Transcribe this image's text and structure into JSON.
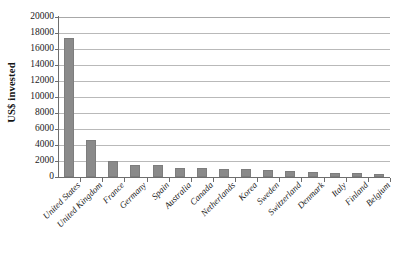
{
  "chart_data": {
    "type": "bar",
    "title": "",
    "xlabel": "",
    "ylabel": "US$ invested",
    "ylim": [
      0,
      20000
    ],
    "ytick_step": 2000,
    "grid": true,
    "legend": "none",
    "bar_color": "#8a8a8a",
    "gridline_color": "#b9b9b9",
    "axis_color": "#6e6e6e",
    "yticks": [
      "20000",
      "18000",
      "16000",
      "14000",
      "12000",
      "10000",
      "8000",
      "6000",
      "4000",
      "2000",
      "0"
    ],
    "ytick_values": [
      20000,
      18000,
      16000,
      14000,
      12000,
      10000,
      8000,
      6000,
      4000,
      2000,
      0
    ],
    "categories": [
      "United States",
      "United Kingdom",
      "France",
      "Germany",
      "Spain",
      "Australia",
      "Canada",
      "Netherlands",
      "Korea",
      "Sweden",
      "Switzerland",
      "Denmark",
      "Italy",
      "Finland",
      "Belgium"
    ],
    "values": [
      17400,
      4600,
      2000,
      1450,
      1450,
      1150,
      1100,
      1050,
      1000,
      900,
      750,
      600,
      500,
      450,
      400
    ]
  }
}
